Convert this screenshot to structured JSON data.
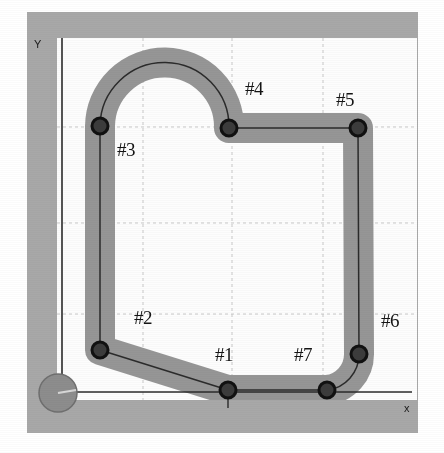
{
  "figure": {
    "type": "robot-path-diagram",
    "canvas": {
      "width": 444,
      "height": 453
    }
  },
  "colors": {
    "page_background": "#ffffff",
    "outer_frame": "#a8a8a8",
    "plot_background": "#fdfdfd",
    "corridor_band": "#969696",
    "path_line": "#2b2b2b",
    "node_fill": "#3c3c3c",
    "node_stroke": "#111111",
    "robot_fill": "#8d8d8d",
    "robot_stroke": "#6f6f6f",
    "axis_line": "#2a2a2a",
    "grid_line": "#c9c9c9",
    "label_text": "#141414"
  },
  "axes": {
    "x_label": "x",
    "y_label": "Y",
    "x_label_pos": {
      "x": 404,
      "y": 403
    },
    "y_label_pos": {
      "x": 34,
      "y": 39
    },
    "x_axis": {
      "x1": 62,
      "y1": 392,
      "x2": 412,
      "y2": 392
    },
    "y_axis": {
      "x1": 62,
      "y1": 38,
      "x2": 62,
      "y2": 398
    },
    "origin_tick": {
      "x": 228,
      "y1": 392,
      "y2": 408
    }
  },
  "grid": {
    "visible": true,
    "style": "dashed",
    "vertical_x": [
      143,
      232,
      323
    ],
    "horizontal_y": [
      127,
      223,
      314
    ]
  },
  "plot_area": {
    "x": 57,
    "y": 38,
    "width": 360,
    "height": 362
  },
  "frame": {
    "x": 27,
    "y": 12,
    "width": 391,
    "height": 421
  },
  "robot": {
    "label": "robot",
    "cx": 58,
    "cy": 393,
    "r": 19,
    "heading_marker": {
      "x1": 58,
      "y1": 393,
      "x2": 76,
      "y2": 390
    }
  },
  "corridor": {
    "band_width": 30,
    "label": "shaded free-space corridor"
  },
  "nodes": [
    {
      "id": "#1",
      "cx": 228,
      "cy": 390,
      "r": 8,
      "label_x": 215,
      "label_y": 345
    },
    {
      "id": "#2",
      "cx": 100,
      "cy": 350,
      "r": 8,
      "label_x": 134,
      "label_y": 308
    },
    {
      "id": "#3",
      "cx": 100,
      "cy": 126,
      "r": 8,
      "label_x": 117,
      "label_y": 140
    },
    {
      "id": "#4",
      "cx": 229,
      "cy": 128,
      "r": 8,
      "label_x": 245,
      "label_y": 79
    },
    {
      "id": "#5",
      "cx": 358,
      "cy": 128,
      "r": 8,
      "label_x": 336,
      "label_y": 90
    },
    {
      "id": "#6",
      "cx": 359,
      "cy": 354,
      "r": 8,
      "label_x": 381,
      "label_y": 311
    },
    {
      "id": "#7",
      "cx": 327,
      "cy": 390,
      "r": 8,
      "label_x": 294,
      "label_y": 345
    }
  ],
  "path": {
    "description": "Closed loop #1 -> #2 -> #3 -> (semicircular arc) -> #4 -> #5 -> #6 -> #7 -> #1",
    "segments": [
      {
        "from": "#1",
        "to": "#2",
        "kind": "line"
      },
      {
        "from": "#2",
        "to": "#3",
        "kind": "line"
      },
      {
        "from": "#3",
        "to": "#4",
        "kind": "arc",
        "note": "semicircle bulging upward, apex near y=64"
      },
      {
        "from": "#4",
        "to": "#5",
        "kind": "line"
      },
      {
        "from": "#5",
        "to": "#6",
        "kind": "line"
      },
      {
        "from": "#6",
        "to": "#7",
        "kind": "arc",
        "note": "quarter-turn corner"
      },
      {
        "from": "#7",
        "to": "#1",
        "kind": "line"
      }
    ]
  }
}
